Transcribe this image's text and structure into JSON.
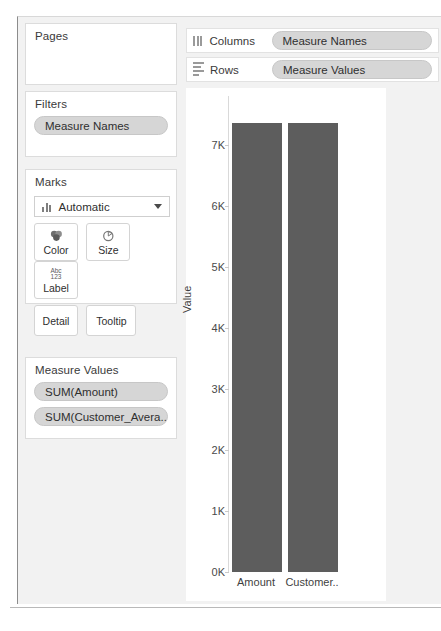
{
  "sidebar": {
    "pages": {
      "title": "Pages"
    },
    "filters": {
      "title": "Filters",
      "pills": [
        {
          "label": "Measure Names"
        }
      ]
    },
    "marks": {
      "title": "Marks",
      "type_icon": "bar-chart-icon",
      "type_value": "Automatic",
      "dropdown_icon": "chevron-down-icon",
      "buttons": [
        {
          "label": "Color",
          "icon": "color-palette-icon"
        },
        {
          "label": "Size",
          "icon": "size-circle-icon"
        },
        {
          "label": "Label",
          "icon": "abc-123-icon",
          "icon_top": "Abc",
          "icon_bottom": "123"
        },
        {
          "label": "Detail",
          "icon": ""
        },
        {
          "label": "Tooltip",
          "icon": ""
        }
      ]
    },
    "measure_values": {
      "title": "Measure Values",
      "pills": [
        {
          "label": "SUM(Amount)"
        },
        {
          "label": "SUM(Customer_Avera.."
        }
      ]
    }
  },
  "shelves": [
    {
      "name": "Columns",
      "icon": "columns-icon",
      "pill": "Measure Names"
    },
    {
      "name": "Rows",
      "icon": "rows-icon",
      "pill": "Measure Values"
    }
  ],
  "colors": {
    "bar_fill": "#5d5d5d",
    "pill_bg": "#d6d6d6",
    "panel_bg": "#f2f2f2",
    "plot_bg": "#ffffff"
  },
  "chart_data": {
    "type": "bar",
    "title": "",
    "categories": [
      "Amount",
      "Customer.."
    ],
    "values": [
      7360,
      7360
    ],
    "xlabel": "",
    "ylabel": "Value",
    "ylim": [
      0,
      7800
    ],
    "ticks": [
      {
        "label": "0K",
        "value": 0
      },
      {
        "label": "1K",
        "value": 1000
      },
      {
        "label": "2K",
        "value": 2000
      },
      {
        "label": "3K",
        "value": 3000
      },
      {
        "label": "4K",
        "value": 4000
      },
      {
        "label": "5K",
        "value": 5000
      },
      {
        "label": "6K",
        "value": 6000
      },
      {
        "label": "7K",
        "value": 7000
      }
    ],
    "grid": false,
    "legend": "none"
  }
}
